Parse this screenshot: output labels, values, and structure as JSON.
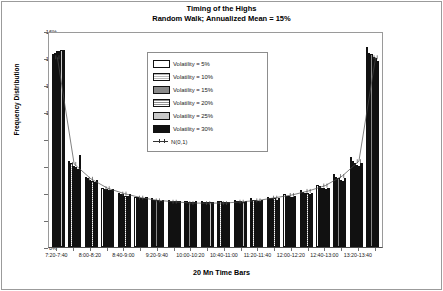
{
  "chart_data": {
    "type": "bar",
    "title": "Timing of the Highs",
    "subtitle": "Random Walk; Annualized Mean = 15%",
    "xlabel": "20 Mn Time Bars",
    "ylabel": "Frequency Distribution",
    "ylim": [
      0,
      16
    ],
    "yticks": [
      "0%",
      "2%",
      "4%",
      "6%",
      "8%",
      "10%",
      "12%",
      "14%",
      "16%"
    ],
    "ytick_values": [
      0,
      2,
      4,
      6,
      8,
      10,
      12,
      14,
      16
    ],
    "grid": false,
    "legend_position": "upper-center-inside",
    "categories": [
      "7:20-7:40",
      "7:40-8:00",
      "8:00-8:20",
      "8:20-8:40",
      "8:40-9:00",
      "9:00-9:20",
      "9:20-9:40",
      "9:40-10:00",
      "10:00-10:20",
      "10:20-10:40",
      "10:40-11:00",
      "11:00-11:20",
      "11:20-11:40",
      "11:40-12:00",
      "12:00-12:20",
      "12:20-12:40",
      "12:40-13:00",
      "13:00-13:20",
      "13:20-13:40",
      "13:40-14:00"
    ],
    "xtick_labels_shown": [
      "7:20-7:40",
      "8:00-8:20",
      "8:40-9:00",
      "9:20-9:40",
      "10:00-10:20",
      "10:40-11:00",
      "11:20-11:40",
      "12:00-12:20",
      "12:40-13:00",
      "13:20-13:40"
    ],
    "series": [
      {
        "name": "Volatility = 5%",
        "values": [
          14.3,
          6.4,
          5.2,
          4.4,
          4.0,
          3.7,
          3.6,
          3.5,
          3.4,
          3.4,
          3.4,
          3.5,
          3.6,
          3.7,
          3.9,
          4.2,
          4.6,
          5.4,
          6.7,
          14.8
        ]
      },
      {
        "name": "Volatility = 10%",
        "values": [
          14.4,
          6.2,
          5.1,
          4.3,
          3.9,
          3.7,
          3.5,
          3.4,
          3.4,
          3.3,
          3.4,
          3.4,
          3.5,
          3.6,
          3.8,
          4.1,
          4.5,
          5.2,
          6.4,
          14.4
        ]
      },
      {
        "name": "Volatility = 15%",
        "values": [
          14.5,
          6.0,
          5.0,
          4.3,
          3.9,
          3.6,
          3.5,
          3.4,
          3.3,
          3.3,
          3.3,
          3.4,
          3.5,
          3.6,
          3.8,
          4.0,
          4.4,
          5.1,
          6.2,
          14.3
        ]
      },
      {
        "name": "Volatility = 20%",
        "values": [
          14.5,
          5.9,
          4.9,
          4.2,
          3.8,
          3.6,
          3.5,
          3.4,
          3.3,
          3.3,
          3.3,
          3.4,
          3.4,
          3.6,
          3.7,
          4.0,
          4.4,
          5.0,
          6.1,
          14.1
        ]
      },
      {
        "name": "Volatility = 25%",
        "values": [
          14.6,
          5.8,
          4.8,
          4.2,
          3.8,
          3.6,
          3.4,
          3.4,
          3.3,
          3.3,
          3.3,
          3.3,
          3.4,
          3.5,
          3.7,
          3.9,
          4.3,
          4.9,
          6.0,
          14.0
        ]
      },
      {
        "name": "Volatility = 30%",
        "values": [
          14.6,
          6.8,
          5.0,
          4.3,
          3.9,
          3.7,
          3.5,
          3.4,
          3.4,
          3.3,
          3.3,
          3.4,
          3.5,
          3.6,
          3.8,
          4.0,
          4.4,
          5.1,
          6.2,
          13.8
        ]
      },
      {
        "name": "N(0,1)",
        "type": "line",
        "values": [
          14.2,
          6.3,
          5.2,
          4.5,
          4.1,
          3.8,
          3.6,
          3.5,
          3.4,
          3.4,
          3.4,
          3.5,
          3.6,
          3.8,
          4.0,
          4.3,
          4.7,
          5.4,
          6.5,
          14.2
        ]
      }
    ],
    "legend": [
      {
        "label": "Volatility = 5%",
        "swatch": "white",
        "color": "#ffffff"
      },
      {
        "label": "Volatility = 10%",
        "swatch": "light-hatch",
        "color": "#dcdcdc"
      },
      {
        "label": "Volatility = 15%",
        "swatch": "mid-gray",
        "color": "#8a8a8a"
      },
      {
        "label": "Volatility = 20%",
        "swatch": "hatch",
        "color": "#b0b0b0"
      },
      {
        "label": "Volatility = 25%",
        "swatch": "light-gray",
        "color": "#c9c9c9"
      },
      {
        "label": "Volatility = 30%",
        "swatch": "black",
        "color": "#111111"
      },
      {
        "label": "N(0,1)",
        "swatch": "line-marker",
        "color": "#333333"
      }
    ]
  }
}
